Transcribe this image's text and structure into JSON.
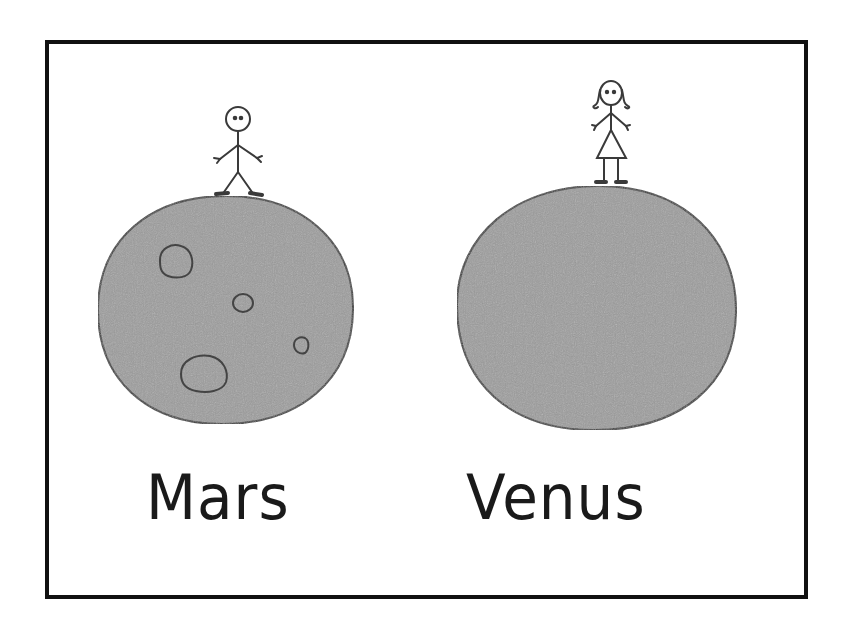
{
  "illustration": {
    "title": "",
    "planets": [
      {
        "name": "Mars",
        "figure": "stick man",
        "craters": 4,
        "fill_color": "#9a9a9a",
        "outline_color": "#333333"
      },
      {
        "name": "Venus",
        "figure": "stick woman",
        "craters": 0,
        "fill_color": "#9a9a9a",
        "outline_color": "#333333"
      }
    ],
    "border_color": "#111111",
    "background_color": "#ffffff"
  }
}
